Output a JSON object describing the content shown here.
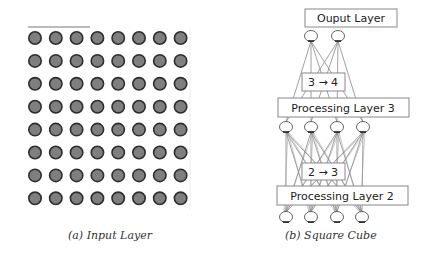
{
  "panel_a": {
    "caption": "(a) Input Layer",
    "grid": {
      "rows": 8,
      "cols": 8,
      "x0": 35,
      "y0": 38,
      "dx": 20.8,
      "dy": 22.9,
      "r": 6.2
    },
    "node_fill": "#7f7f7f",
    "node_stroke": "#2e2e2e"
  },
  "panel_b": {
    "caption": "(b) Square Cube",
    "output_layer_label": "Ouput Layer",
    "transition_top_label": "3 → 4",
    "processing_layer_3_label": "Processing Layer 3",
    "transition_bottom_label": "2 → 3",
    "processing_layer_2_label": "Processing Layer 2",
    "output_nodes_x": [
      311,
      338
    ],
    "layer3_nodes_x": [
      286,
      311,
      337,
      363
    ],
    "layer2_nodes_x": [
      286,
      311,
      337,
      362
    ]
  }
}
